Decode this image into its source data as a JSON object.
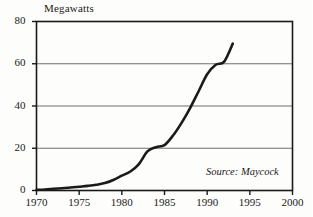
{
  "chart_data": {
    "type": "line",
    "title": "Megawatts",
    "xlabel": "",
    "ylabel": "Megawatts",
    "xlim": [
      1970,
      2000
    ],
    "ylim": [
      0,
      80
    ],
    "grid": true,
    "legend": null,
    "y_ticks": [
      0,
      20,
      40,
      60,
      80
    ],
    "x_ticks": [
      1970,
      1975,
      1980,
      1985,
      1990,
      1995,
      2000
    ],
    "y_tick_labels": [
      "0",
      "20",
      "40",
      "60",
      "80"
    ],
    "x_tick_labels": [
      "1970",
      "1975",
      "1980",
      "1985",
      "1990",
      "1995",
      "2000"
    ],
    "annotation": "Source: Maycock",
    "line_color": "#1a1a1a",
    "grid_color": "#6f6f6f",
    "series": [
      {
        "name": "Megawatts",
        "x": [
          1970,
          1971,
          1972,
          1973,
          1974,
          1975,
          1976,
          1977,
          1978,
          1979,
          1980,
          1981,
          1982,
          1983,
          1984,
          1985,
          1986,
          1987,
          1988,
          1989,
          1990,
          1991,
          1992,
          1993
        ],
        "values": [
          0.3,
          0.5,
          0.8,
          1.1,
          1.4,
          1.8,
          2.2,
          2.7,
          3.5,
          5.0,
          7.0,
          9.0,
          12.5,
          18.5,
          20.5,
          21.5,
          26.0,
          32.0,
          39.0,
          47.0,
          55.0,
          59.5,
          61.0,
          69.5
        ]
      }
    ]
  },
  "labels": {
    "title": "Megawatts",
    "source": "Source: Maycock"
  }
}
